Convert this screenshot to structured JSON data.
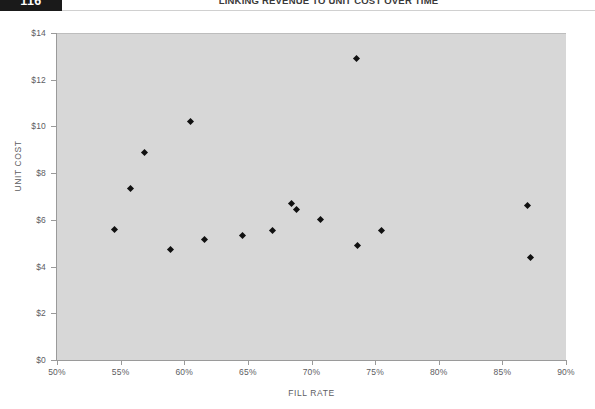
{
  "header": {
    "page_number": "116",
    "title": "LINKING REVENUE TO UNIT COST OVER TIME"
  },
  "chart_data": {
    "type": "scatter",
    "title": "",
    "xlabel": "FILL RATE",
    "ylabel": "UNIT COST",
    "xlim": [
      50,
      90
    ],
    "ylim": [
      0,
      14
    ],
    "grid": false,
    "legend": "none",
    "xticks": [
      50,
      55,
      60,
      65,
      70,
      75,
      80,
      85,
      90
    ],
    "xtick_labels": [
      "50%",
      "55%",
      "60%",
      "65%",
      "70%",
      "75%",
      "80%",
      "85%",
      "90%"
    ],
    "yticks": [
      0,
      2,
      4,
      6,
      8,
      10,
      12,
      14
    ],
    "ytick_labels": [
      "$0",
      "$2",
      "$4",
      "$6",
      "$8",
      "$10",
      "$12",
      "$14"
    ],
    "marker_shape": "diamond",
    "marker_color": "#111111",
    "plot_background": "#d7d7d7",
    "points": [
      {
        "x": 54.5,
        "y": 5.6
      },
      {
        "x": 55.8,
        "y": 7.35
      },
      {
        "x": 56.9,
        "y": 8.9
      },
      {
        "x": 58.9,
        "y": 4.75
      },
      {
        "x": 60.5,
        "y": 10.2
      },
      {
        "x": 61.6,
        "y": 5.15
      },
      {
        "x": 64.6,
        "y": 5.35
      },
      {
        "x": 66.9,
        "y": 5.55
      },
      {
        "x": 68.4,
        "y": 6.7
      },
      {
        "x": 68.8,
        "y": 6.45
      },
      {
        "x": 70.7,
        "y": 6.0
      },
      {
        "x": 73.5,
        "y": 12.9
      },
      {
        "x": 73.6,
        "y": 4.9
      },
      {
        "x": 75.5,
        "y": 5.55
      },
      {
        "x": 87.0,
        "y": 6.6
      },
      {
        "x": 87.2,
        "y": 4.4
      }
    ]
  }
}
